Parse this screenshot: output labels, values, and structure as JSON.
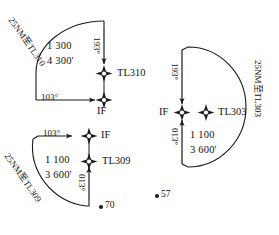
{
  "figure": {
    "type": "aeronautical-procedure-diagram",
    "background_color": "#ffffff",
    "line_color": "#1a1a1a",
    "text_color": "#111111"
  },
  "procedures": [
    {
      "id": "tl310",
      "waypoint_label": "TL310",
      "if_label": "IF",
      "inbound_bearing": "103°",
      "outbound_bearing": "193°",
      "speed": "1 300",
      "altitude": "4 300'",
      "arc_label": "25NM至TL310"
    },
    {
      "id": "tl309",
      "waypoint_label": "TL309",
      "if_label": "IF",
      "inbound_bearing": "103°",
      "outbound_bearing": "013°",
      "speed": "1 100",
      "altitude": "3 600'",
      "arc_label": "25NM至TL309"
    },
    {
      "id": "tl303",
      "waypoint_label": "TL303",
      "if_label": "IF",
      "inbound_bearing": "193°",
      "outbound_bearing": "013°",
      "speed": "1 100",
      "altitude": "3 600'",
      "arc_label": "25NM至TL303"
    }
  ],
  "spot_points": [
    {
      "id": "spot-70",
      "label": "70"
    },
    {
      "id": "spot-57",
      "label": "57"
    }
  ]
}
